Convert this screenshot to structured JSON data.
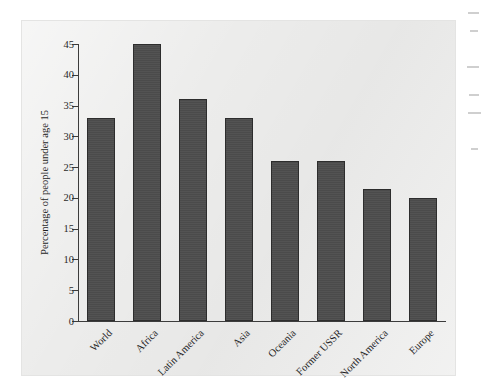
{
  "chart_data": {
    "type": "bar",
    "title": "",
    "xlabel": "",
    "ylabel": "Percentage of people under age 15",
    "categories": [
      "World",
      "Africa",
      "Latin America",
      "Asia",
      "Oceania",
      "Former USSR",
      "North America",
      "Europe"
    ],
    "values": [
      33,
      45,
      36,
      33,
      26,
      26,
      21.5,
      20
    ],
    "ylim": [
      0,
      45
    ],
    "yticks": [
      0,
      5,
      10,
      15,
      20,
      25,
      30,
      35,
      40,
      45
    ],
    "ytick_labels": [
      "0",
      "5",
      "10",
      "15",
      "20",
      "25",
      "30",
      "35",
      "40",
      "45"
    ],
    "grid": false,
    "legend": null,
    "series": [
      {
        "name": "Percentage of people under age 15",
        "values": [
          33,
          45,
          36,
          33,
          26,
          26,
          21.5,
          20
        ]
      }
    ],
    "bar_color": "#4d4d4d",
    "bar_border_color": "#2d2d2d",
    "axis_color": "#3c3c3c",
    "panel_color": "#ececeb",
    "page_color": "#ffffff",
    "xtick_label_rotation": -45
  }
}
